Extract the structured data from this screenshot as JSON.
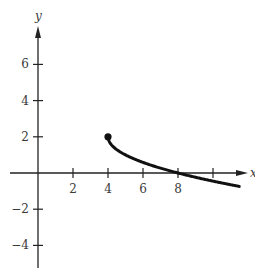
{
  "chart_data": {
    "type": "line",
    "title": "",
    "xlabel": "x",
    "ylabel": "y",
    "xlim": [
      -1,
      12
    ],
    "ylim": [
      -5,
      8
    ],
    "grid": false,
    "legend": null,
    "x_ticks": [
      2,
      4,
      6,
      8,
      10
    ],
    "x_tick_labels": [
      "2",
      "4",
      "6",
      "8",
      ""
    ],
    "y_ticks": [
      6,
      4,
      2,
      -2,
      -4
    ],
    "y_tick_labels": [
      "6",
      "4",
      "2",
      "−2",
      "−4"
    ],
    "series": [
      {
        "name": "curve",
        "function": "y = 2 - sqrt(x - 4)",
        "x": [
          4,
          4.25,
          5,
          6,
          7,
          8,
          9,
          10,
          11,
          11.5
        ],
        "y": [
          2,
          1.5,
          1,
          0.59,
          0.27,
          0,
          -0.24,
          -0.45,
          -0.65,
          -0.74
        ],
        "start_point": {
          "x": 4,
          "y": 2,
          "marker": "filled-dot"
        },
        "color": "#111111"
      }
    ],
    "annotations": []
  },
  "axes": {
    "x_axis_label": "x",
    "y_axis_label": "y",
    "color": "#222222"
  }
}
